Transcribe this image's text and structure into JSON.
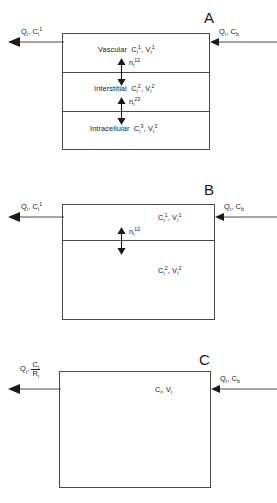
{
  "figure": {
    "type": "compartment-model-diagram",
    "panel_count": 3
  },
  "panels": [
    {
      "letter": "A",
      "name": "three-compartment-model",
      "inflow_label": "Qᵢ, Cᵦ",
      "inflow_label_parts": {
        "flow": "Q",
        "flow_sub": "i",
        "conc": "C",
        "conc_sub": "b"
      },
      "outflow_label_parts": {
        "flow": "Q",
        "flow_sub": "i",
        "conc": "C",
        "conc_sub": "i",
        "conc_sup": "1"
      },
      "compartments": [
        {
          "name": "Vascular",
          "conc": "C",
          "conc_sub": "i",
          "conc_sup": "1",
          "vol": "V",
          "vol_sub": "i",
          "vol_sup": "1"
        },
        {
          "name": "Interstitial",
          "conc": "C",
          "conc_sub": "i",
          "conc_sup": "2",
          "vol": "V",
          "vol_sub": "i",
          "vol_sup": "2"
        },
        {
          "name": "Intracellular",
          "conc": "C",
          "conc_sub": "i",
          "conc_sup": "3",
          "vol": "V",
          "vol_sub": "i",
          "vol_sup": "3"
        }
      ],
      "fluxes": [
        {
          "symbol": "n",
          "sub": "i",
          "sup": "12"
        },
        {
          "symbol": "n",
          "sub": "i",
          "sup": "23"
        }
      ]
    },
    {
      "letter": "B",
      "name": "two-compartment-model",
      "inflow_label_parts": {
        "flow": "Q",
        "flow_sub": "i",
        "conc": "C",
        "conc_sub": "b"
      },
      "outflow_label_parts": {
        "flow": "Q",
        "flow_sub": "i",
        "conc": "C",
        "conc_sub": "i",
        "conc_sup": "1"
      },
      "compartments": [
        {
          "name": "",
          "conc": "C",
          "conc_sub": "i",
          "conc_sup": "1",
          "vol": "V",
          "vol_sub": "i",
          "vol_sup": "1"
        },
        {
          "name": "",
          "conc": "C",
          "conc_sub": "i",
          "conc_sup": "2",
          "vol": "V",
          "vol_sub": "i",
          "vol_sup": "2"
        }
      ],
      "fluxes": [
        {
          "symbol": "n",
          "sub": "i",
          "sup": "12"
        }
      ]
    },
    {
      "letter": "C",
      "name": "one-compartment-model",
      "inflow_label_parts": {
        "flow": "Q",
        "flow_sub": "i",
        "conc": "C",
        "conc_sub": "b"
      },
      "outflow_label_parts": {
        "flow": "Q",
        "flow_sub": "i",
        "numerator": "C",
        "numerator_sub": "i",
        "denominator": "R",
        "denominator_sub": "i"
      },
      "compartments": [
        {
          "name": "",
          "conc": "C",
          "conc_sub": "i",
          "vol": "V",
          "vol_sub": "i"
        }
      ],
      "fluxes": []
    }
  ],
  "style": {
    "line_color": "#4a4a4a",
    "text_color": "#1a1a1a",
    "background": "#ffffff"
  }
}
